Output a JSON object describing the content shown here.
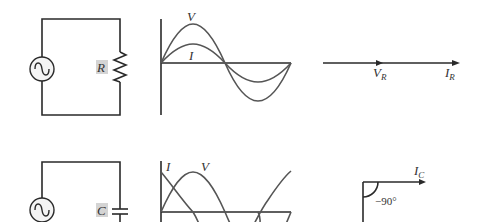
{
  "figure": {
    "rows": [
      {
        "component": "resistor",
        "circuit": {
          "source": "ac-source",
          "element_label": "R"
        },
        "waveform": {
          "curves": [
            {
              "name": "V",
              "label": "V"
            },
            {
              "name": "I",
              "label": "I"
            }
          ],
          "phase_relation": "in phase"
        },
        "phasor": {
          "labels": [
            {
              "main": "V",
              "sub": "R"
            },
            {
              "main": "I",
              "sub": "R"
            }
          ]
        }
      },
      {
        "component": "capacitor",
        "circuit": {
          "source": "ac-source",
          "element_label": "C"
        },
        "waveform": {
          "curves": [
            {
              "name": "I",
              "label": "I"
            },
            {
              "name": "V",
              "label": "V"
            }
          ],
          "phase_relation": "current leads voltage by 90°"
        },
        "phasor": {
          "labels": [
            {
              "main": "I",
              "sub": "C"
            }
          ],
          "angle_label": "−90°"
        }
      }
    ]
  },
  "colors": {
    "wire": "#2a2a2a",
    "curve": "#555555",
    "label_bg": "#d4d4d4"
  }
}
